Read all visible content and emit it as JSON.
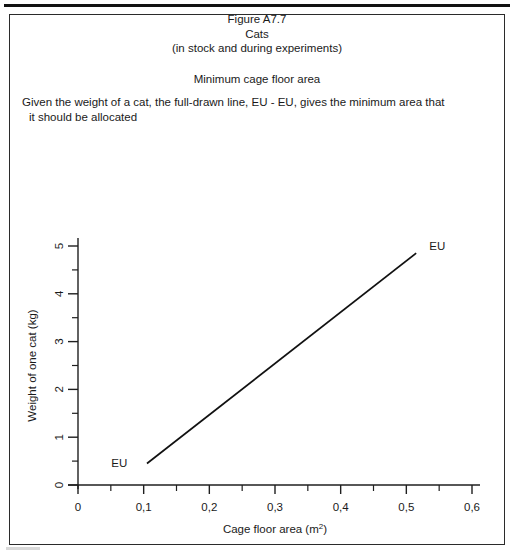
{
  "page": {
    "figure_number": "Figure A7.7",
    "species": "Cats",
    "context": "(in stock and during experiments)",
    "subtitle": "Minimum cage floor area",
    "description_line_1": "Given the weight of a cat, the full-drawn line, EU - EU, gives the minimum area that",
    "description_line_2": "it should be allocated"
  },
  "chart_data": {
    "type": "line",
    "title": "Minimum cage floor area",
    "xlabel": "Cage floor area (m",
    "xlabel_superscript": "2",
    "xlabel_suffix": ")",
    "xlabel_full": "Cage floor area (m2)",
    "ylabel": "Weight of one cat (kg)",
    "xlim": [
      0,
      0.6
    ],
    "ylim": [
      0,
      5
    ],
    "grid": false,
    "legend_position": "inline-endpoint-labels",
    "x_tick_labels": [
      "0",
      "0,1",
      "0,2",
      "0,3",
      "0,4",
      "0,5",
      "0,6"
    ],
    "x_tick_values": [
      0,
      0.1,
      0.2,
      0.3,
      0.4,
      0.5,
      0.6
    ],
    "x_minor_tick_values": [
      0.05,
      0.15,
      0.25,
      0.35,
      0.45,
      0.55
    ],
    "y_tick_labels": [
      "0",
      "1",
      "2",
      "3",
      "4",
      "5"
    ],
    "y_tick_values": [
      0,
      1,
      2,
      3,
      4,
      5
    ],
    "y_minor_tick_values": [
      0.5,
      1.5,
      2.5,
      3.5,
      4.5
    ],
    "series": [
      {
        "name": "EU - EU",
        "x": [
          0.105,
          0.515
        ],
        "y": [
          0.45,
          4.85
        ],
        "start_label": "EU",
        "end_label": "EU"
      }
    ],
    "annotations": [
      {
        "text": "EU",
        "x": 0.075,
        "y": 0.45,
        "align": "end"
      },
      {
        "text": "EU",
        "x": 0.535,
        "y": 5.0,
        "align": "start"
      }
    ]
  }
}
